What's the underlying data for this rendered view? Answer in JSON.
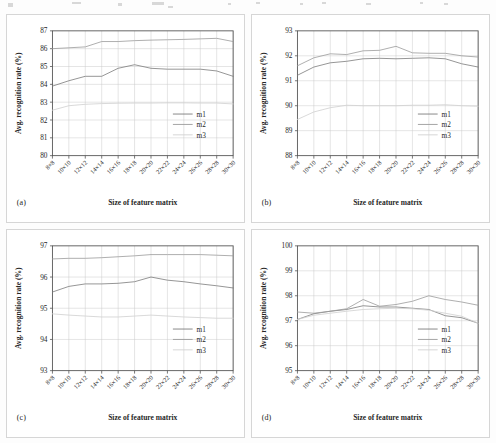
{
  "figure": {
    "panels": [
      "a",
      "b",
      "c",
      "d"
    ],
    "xlabel": "Size of feature matrix",
    "ylabel": "Avg. recognition  rate (%)",
    "categories": [
      "8×8",
      "10×10",
      "12×12",
      "14×14",
      "16×16",
      "18×18",
      "20×20",
      "22×22",
      "24×24",
      "26×26",
      "28×28",
      "30×30"
    ],
    "legend": [
      "m1",
      "m2",
      "m3"
    ],
    "colors": {
      "m1": "#7a7a7a",
      "m2": "#9a9a9a",
      "m3": "#d2d2d2",
      "grid": "#c9c9c9",
      "axis": "#555555",
      "panel_border": "#d6d6d6"
    }
  },
  "panel_a": {
    "letter": "(a)",
    "xlabel": "Size of feature matrix",
    "ylabel": "Avg. recognition  rate (%)",
    "yticks": [
      "80",
      "81",
      "82",
      "83",
      "84",
      "85",
      "86",
      "87"
    ],
    "legend": [
      "m1",
      "m2",
      "m3"
    ]
  },
  "panel_b": {
    "letter": "(b)",
    "xlabel": "Size of feature matrix",
    "ylabel": "Avg. recognition  rate (%)",
    "yticks": [
      "88",
      "89",
      "90",
      "91",
      "92",
      "93"
    ],
    "legend": [
      "m1",
      "m2",
      "m3"
    ]
  },
  "panel_c": {
    "letter": "(c)",
    "xlabel": "Size of feature matrix",
    "ylabel": "Avg. recognition  rate (%)",
    "yticks": [
      "93",
      "94",
      "95",
      "96",
      "97"
    ],
    "legend": [
      "m1",
      "m2",
      "m3"
    ]
  },
  "panel_d": {
    "letter": "(d)",
    "xlabel": "Size of feature matrix",
    "ylabel": "Avg. recognition  rate (%)",
    "yticks": [
      "95",
      "96",
      "97",
      "98",
      "99",
      "100"
    ],
    "legend": [
      "m1",
      "m2",
      "m3"
    ]
  },
  "chart_data": [
    {
      "id": "a",
      "type": "line",
      "title": "(a)",
      "xlabel": "Size of feature matrix",
      "ylabel": "Avg. recognition  rate (%)",
      "categories": [
        "8×8",
        "10×10",
        "12×12",
        "14×14",
        "16×16",
        "18×18",
        "20×20",
        "22×22",
        "24×24",
        "26×26",
        "28×28",
        "30×30"
      ],
      "ylim": [
        80,
        87
      ],
      "yticks": [
        80,
        81,
        82,
        83,
        84,
        85,
        86,
        87
      ],
      "grid": true,
      "legend_position": "lower-right",
      "series": [
        {
          "name": "m1",
          "values": [
            83.9,
            84.2,
            84.45,
            84.45,
            84.9,
            85.1,
            84.9,
            84.85,
            84.85,
            84.85,
            84.75,
            84.45
          ]
        },
        {
          "name": "m2",
          "values": [
            86.0,
            86.05,
            86.1,
            86.4,
            86.4,
            86.45,
            86.48,
            86.5,
            86.52,
            86.55,
            86.58,
            86.4
          ]
        },
        {
          "name": "m3",
          "values": [
            82.55,
            82.8,
            82.88,
            82.92,
            82.94,
            82.95,
            82.95,
            82.96,
            82.96,
            82.95,
            82.95,
            82.9
          ]
        }
      ]
    },
    {
      "id": "b",
      "type": "line",
      "title": "(b)",
      "xlabel": "Size of feature matrix",
      "ylabel": "Avg. recognition  rate (%)",
      "categories": [
        "8×8",
        "10×10",
        "12×12",
        "14×14",
        "16×16",
        "18×18",
        "20×20",
        "22×22",
        "24×24",
        "26×26",
        "28×28",
        "30×30"
      ],
      "ylim": [
        88,
        93
      ],
      "yticks": [
        88,
        89,
        90,
        91,
        92,
        93
      ],
      "grid": true,
      "legend_position": "lower-right",
      "series": [
        {
          "name": "m1",
          "values": [
            91.22,
            91.55,
            91.72,
            91.78,
            91.88,
            91.9,
            91.88,
            91.9,
            91.92,
            91.88,
            91.68,
            91.55
          ]
        },
        {
          "name": "m2",
          "values": [
            91.6,
            91.92,
            92.08,
            92.05,
            92.2,
            92.22,
            92.38,
            92.12,
            92.1,
            92.1,
            92.0,
            91.95
          ]
        },
        {
          "name": "m3",
          "values": [
            89.45,
            89.75,
            89.92,
            90.02,
            90.0,
            90.0,
            90.0,
            90.02,
            90.02,
            90.04,
            90.0,
            89.98
          ]
        }
      ]
    },
    {
      "id": "c",
      "type": "line",
      "title": "(c)",
      "xlabel": "Size of feature matrix",
      "ylabel": "Avg. recognition  rate (%)",
      "categories": [
        "8×8",
        "10×10",
        "12×12",
        "14×14",
        "16×16",
        "18×18",
        "20×20",
        "22×22",
        "24×24",
        "26×26",
        "28×28",
        "30×30"
      ],
      "ylim": [
        93,
        97
      ],
      "yticks": [
        93,
        94,
        95,
        96,
        97
      ],
      "grid": true,
      "legend_position": "lower-right",
      "series": [
        {
          "name": "m1",
          "values": [
            95.52,
            95.7,
            95.78,
            95.78,
            95.8,
            95.85,
            96.0,
            95.9,
            95.85,
            95.78,
            95.72,
            95.65
          ]
        },
        {
          "name": "m2",
          "values": [
            96.58,
            96.6,
            96.6,
            96.62,
            96.65,
            96.68,
            96.72,
            96.72,
            96.72,
            96.72,
            96.7,
            96.68
          ]
        },
        {
          "name": "m3",
          "values": [
            94.82,
            94.78,
            94.75,
            94.72,
            94.72,
            94.75,
            94.78,
            94.75,
            94.72,
            94.7,
            94.68,
            94.68
          ]
        }
      ]
    },
    {
      "id": "d",
      "type": "line",
      "title": "(d)",
      "xlabel": "Size of feature matrix",
      "ylabel": "Avg. recognition  rate (%)",
      "categories": [
        "8×8",
        "10×10",
        "12×12",
        "14×14",
        "16×16",
        "18×18",
        "20×20",
        "22×22",
        "24×24",
        "26×26",
        "28×28",
        "30×30"
      ],
      "ylim": [
        95,
        100
      ],
      "yticks": [
        95,
        96,
        97,
        98,
        99,
        100
      ],
      "grid": true,
      "legend_position": "lower-right",
      "series": [
        {
          "name": "m1",
          "values": [
            97.05,
            97.28,
            97.38,
            97.45,
            97.6,
            97.55,
            97.55,
            97.5,
            97.45,
            97.2,
            97.12,
            96.9
          ]
        },
        {
          "name": "m2",
          "values": [
            97.35,
            97.3,
            97.38,
            97.48,
            97.85,
            97.58,
            97.65,
            97.78,
            98.0,
            97.85,
            97.75,
            97.62
          ]
        },
        {
          "name": "m3",
          "values": [
            97.05,
            97.22,
            97.3,
            97.38,
            97.45,
            97.48,
            97.5,
            97.48,
            97.42,
            97.3,
            97.18,
            96.9
          ]
        }
      ]
    }
  ]
}
